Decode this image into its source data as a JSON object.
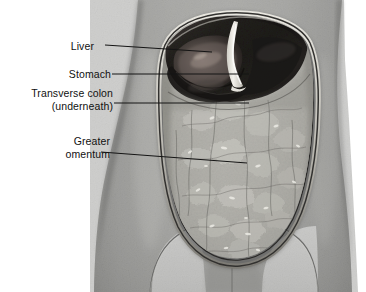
{
  "figure": {
    "type": "anatomical-illustration",
    "view": "anterior",
    "rendering": "grayscale halftone medical illustration",
    "background_color": "#ffffff",
    "palette": {
      "skin_mid": "#9a9a98",
      "skin_light": "#b5b5b2",
      "skin_dark": "#6f6f6d",
      "omentum_light": "#b9b8b3",
      "omentum_mid": "#a3a29c",
      "cavity_dark": "#2e2e2e",
      "cavity_black": "#121212",
      "liver_brown": "#4a4442",
      "highlight_white": "#f2f1ec",
      "outline": "#3a3a3a",
      "leader_line": "#1a1a1a",
      "label_text": "#111111"
    }
  },
  "labels": [
    {
      "id": "liver",
      "lines": [
        "Liver"
      ],
      "text": "Liver",
      "leader": {
        "x1": 105,
        "y1": 45,
        "x2": 212,
        "y2": 52,
        "style": "straight"
      }
    },
    {
      "id": "stomach",
      "lines": [
        "Stomach"
      ],
      "text": "Stomach",
      "leader": {
        "x1": 112,
        "y1": 74,
        "x2": 249,
        "y2": 74,
        "style": "straight"
      }
    },
    {
      "id": "transverse-colon",
      "lines": [
        "Transverse colon",
        "(underneath)"
      ],
      "text": "Transverse colon (underneath)",
      "leader": {
        "x1": 114,
        "y1": 103,
        "x2": 249,
        "y2": 103,
        "style": "straight"
      }
    },
    {
      "id": "greater-omentum",
      "lines": [
        "Greater",
        "omentum"
      ],
      "text": "Greater omentum",
      "leader": {
        "x1": 101,
        "y1": 152,
        "x2": 247,
        "y2": 163,
        "style": "straight"
      }
    }
  ],
  "structures": [
    {
      "name": "liver",
      "description": "dark wedge at upper left of cavity"
    },
    {
      "name": "stomach",
      "description": "dark region left of falciform ligament"
    },
    {
      "name": "transverse colon",
      "description": "hidden beneath the omentum"
    },
    {
      "name": "greater omentum",
      "description": "large fatty apron filling the cavity"
    },
    {
      "name": "falciform ligament",
      "description": "bright white vertical band at midline of cavity rim"
    },
    {
      "name": "abdominal wall",
      "description": "reflected cut edge forming the cavity border"
    },
    {
      "name": "inguinal folds",
      "description": "paired diagonal creases at lower torso"
    }
  ]
}
